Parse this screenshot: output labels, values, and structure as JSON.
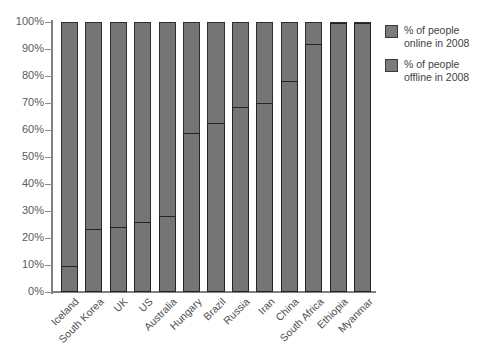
{
  "chart_data": {
    "type": "bar",
    "title": "",
    "subtitle": "",
    "xlabel": "",
    "ylabel": "",
    "ylim": [
      0,
      100
    ],
    "grid": false,
    "stacked": true,
    "legend_position": "right",
    "y_ticks": [
      "0%",
      "10%",
      "20%",
      "30%",
      "40%",
      "50%",
      "60%",
      "70%",
      "80%",
      "90%",
      "100%"
    ],
    "y_tick_values": [
      0,
      10,
      20,
      30,
      40,
      50,
      60,
      70,
      80,
      90,
      100
    ],
    "categories": [
      "Iceland",
      "South Korea",
      "UK",
      "US",
      "Australia",
      "Hungary",
      "Brazil",
      "Russia",
      "Iran",
      "China",
      "South Africa",
      "Ethiopia",
      "Myanmar"
    ],
    "series": [
      {
        "name": "% of people online in 2008",
        "values": [
          9.5,
          23.5,
          24,
          26,
          28,
          59,
          62.5,
          68.5,
          70,
          78,
          92,
          99.5,
          99.8
        ]
      },
      {
        "name": "% of people offline in 2008",
        "values": [
          90.5,
          76.5,
          76,
          74,
          72,
          41,
          37.5,
          31.5,
          30,
          22,
          8,
          0.5,
          0.2
        ]
      }
    ],
    "colors": {
      "bar_fill": "#757575",
      "bar_outline": "#2e2e2e",
      "axis": "#808080",
      "tick_label": "#5a5a5a",
      "background": "#ffffff"
    }
  },
  "legend": {
    "items": [
      {
        "label": "% of people\nonline in 2008",
        "swatch_color": "#7b7b7b"
      },
      {
        "label": "% of people\noffline in 2008",
        "swatch_color": "#7b7b7b"
      }
    ]
  }
}
